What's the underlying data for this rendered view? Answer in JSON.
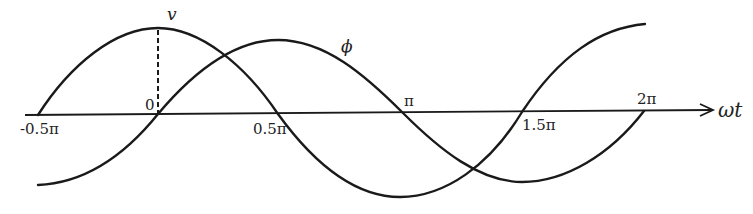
{
  "diagram": {
    "type": "waveform",
    "axis": {
      "label": "ωt",
      "ticks": [
        {
          "label": "-0.5π",
          "x": 38
        },
        {
          "label": "0",
          "x": 158
        },
        {
          "label": "0.5π",
          "x": 278
        },
        {
          "label": "π",
          "x": 403
        },
        {
          "label": "1.5π",
          "x": 522
        },
        {
          "label": "2π",
          "x": 644
        }
      ]
    },
    "curves": [
      {
        "name": "v",
        "label": "v",
        "description": "cosine-like: peak at 0, zero at -0.5π and 0.5π, trough at π, zero at 1.5π, rising to peak near 2π"
      },
      {
        "name": "phi",
        "label": "ϕ",
        "description": "sine-like: trough at -0.5π, zero at 0, peak at 0.5π, zero at π, trough at 1.5π, zero at 2π"
      }
    ],
    "markers": [
      {
        "type": "dashed-vertical",
        "from": "v peak",
        "to": "origin"
      }
    ],
    "stroke_color": "#1a1a1a",
    "background": "#ffffff"
  }
}
